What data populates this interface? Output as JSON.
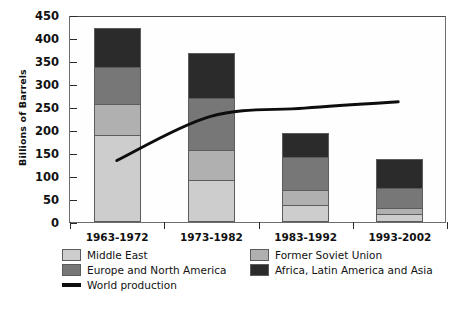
{
  "chart_data": {
    "type": "bar",
    "title": "",
    "xlabel": "",
    "ylabel": "Billions of Barrels",
    "ylim": [
      0,
      450
    ],
    "ytick_step": 50,
    "yticks": [
      0,
      50,
      100,
      150,
      200,
      250,
      300,
      350,
      400,
      450
    ],
    "categories": [
      "1963-1972",
      "1973-1982",
      "1983-1992",
      "1993-2002"
    ],
    "stacked": true,
    "grid": false,
    "legend_position": "bottom-left",
    "series": [
      {
        "name": "Middle East",
        "color": "#cdcdcd",
        "values": [
          188,
          90,
          35,
          15
        ]
      },
      {
        "name": "Former Soviet Union",
        "color": "#b0b0b0",
        "values": [
          67,
          65,
          33,
          13
        ]
      },
      {
        "name": "Europe and North America",
        "color": "#777777",
        "values": [
          80,
          113,
          72,
          44
        ]
      },
      {
        "name": "Africa, Latin America and Asia",
        "color": "#2b2b2b",
        "values": [
          85,
          97,
          52,
          63
        ]
      }
    ],
    "stack_totals": [
      420,
      365,
      192,
      135
    ],
    "overlay_line": {
      "name": "World production",
      "color": "#0d0d0d",
      "x": [
        "1963-1972",
        "1973-1982",
        "1983-1992",
        "1993-2002"
      ],
      "values": [
        135,
        232,
        250,
        264
      ]
    }
  },
  "legend": {
    "rows": [
      [
        {
          "label": "Middle East",
          "swatch": "#cdcdcd",
          "kind": "box"
        },
        {
          "label": "Former Soviet Union",
          "swatch": "#b0b0b0",
          "kind": "box"
        }
      ],
      [
        {
          "label": "Europe and North America",
          "swatch": "#777777",
          "kind": "box"
        },
        {
          "label": "Africa, Latin America and Asia",
          "swatch": "#2b2b2b",
          "kind": "box"
        }
      ],
      [
        {
          "label": "World production",
          "swatch": "#0d0d0d",
          "kind": "line"
        }
      ]
    ]
  }
}
